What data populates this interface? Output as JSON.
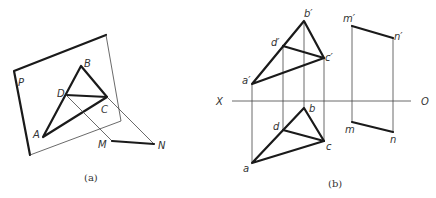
{
  "figure_a": {
    "caption": "(a)",
    "labels": {
      "plane": "P",
      "A": "A",
      "B": "B",
      "C": "C",
      "D": "D",
      "M": "M",
      "N": "N"
    }
  },
  "figure_b": {
    "caption": "(b)",
    "axis": {
      "left": "X",
      "right": "O"
    },
    "labels": {
      "a_prime": "a′",
      "b_prime": "b′",
      "c_prime": "c′",
      "d_prime": "d′",
      "m_prime": "m′",
      "n_prime": "n′",
      "a": "a",
      "b": "b",
      "c": "c",
      "d": "d",
      "m": "m",
      "n": "n"
    }
  }
}
